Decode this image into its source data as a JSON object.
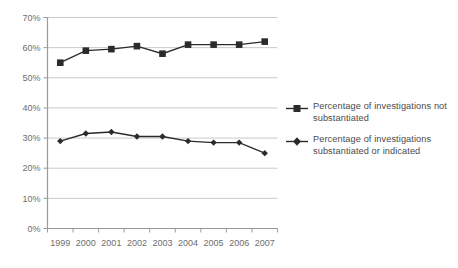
{
  "chart_data": {
    "type": "line",
    "title": "",
    "xlabel": "",
    "ylabel": "",
    "categories": [
      "1999",
      "2000",
      "2001",
      "2002",
      "2003",
      "2004",
      "2005",
      "2006",
      "2007"
    ],
    "ylim": [
      0,
      70
    ],
    "ytick_labels": [
      "0%",
      "10%",
      "20%",
      "30%",
      "40%",
      "50%",
      "60%",
      "70%"
    ],
    "ytick_values": [
      0,
      10,
      20,
      30,
      40,
      50,
      60,
      70
    ],
    "grid": true,
    "legend_position": "right",
    "series": [
      {
        "name": "Percentage of investigations not substantiated",
        "marker": "square",
        "color": "#2b2b2b",
        "values": [
          55.0,
          59.0,
          59.5,
          60.5,
          58.0,
          61.0,
          61.0,
          61.0,
          62.0
        ]
      },
      {
        "name": "Percentage of investigations substantiated or indicated",
        "marker": "diamond",
        "color": "#2b2b2b",
        "values": [
          29.0,
          31.5,
          32.0,
          30.5,
          30.5,
          29.0,
          28.5,
          28.5,
          25.0
        ]
      }
    ]
  },
  "legend": {
    "items": [
      {
        "label_line1": "Percentage of investigations not",
        "label_line2": "substantiated",
        "marker": "square"
      },
      {
        "label_line1": "Percentage of investigations",
        "label_line2": "substantiated or indicated",
        "marker": "diamond"
      }
    ]
  },
  "colors": {
    "series": "#2b2b2b",
    "grid": "#c9c9c9",
    "axis": "#9a9a9a",
    "tick_text": "#6e6e6e",
    "legend_text": "#4a4a4a",
    "background": "#ffffff"
  }
}
